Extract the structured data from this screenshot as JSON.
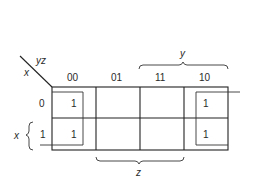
{
  "diagram": {
    "type": "karnaugh-map",
    "variables": {
      "row_var": "x",
      "col_vars": "yz"
    },
    "column_headers": [
      "00",
      "01",
      "11",
      "10"
    ],
    "row_headers": [
      "0",
      "1"
    ],
    "cells": [
      [
        "1",
        "",
        "",
        "1"
      ],
      [
        "1",
        "",
        "",
        "1"
      ]
    ],
    "braces": {
      "top": {
        "label": "y",
        "spans_columns": [
          "11",
          "10"
        ]
      },
      "bottom": {
        "label": "z",
        "spans_columns": [
          "01",
          "11"
        ]
      },
      "left": {
        "label": "x",
        "spans_rows": [
          "1"
        ]
      }
    },
    "groups": [
      {
        "name": "wraparound-group",
        "columns": [
          "00",
          "10"
        ],
        "rows": [
          "0",
          "1"
        ]
      }
    ],
    "colors": {
      "line": "#222222",
      "text": "#2a2a2a",
      "background": "#ffffff"
    }
  }
}
